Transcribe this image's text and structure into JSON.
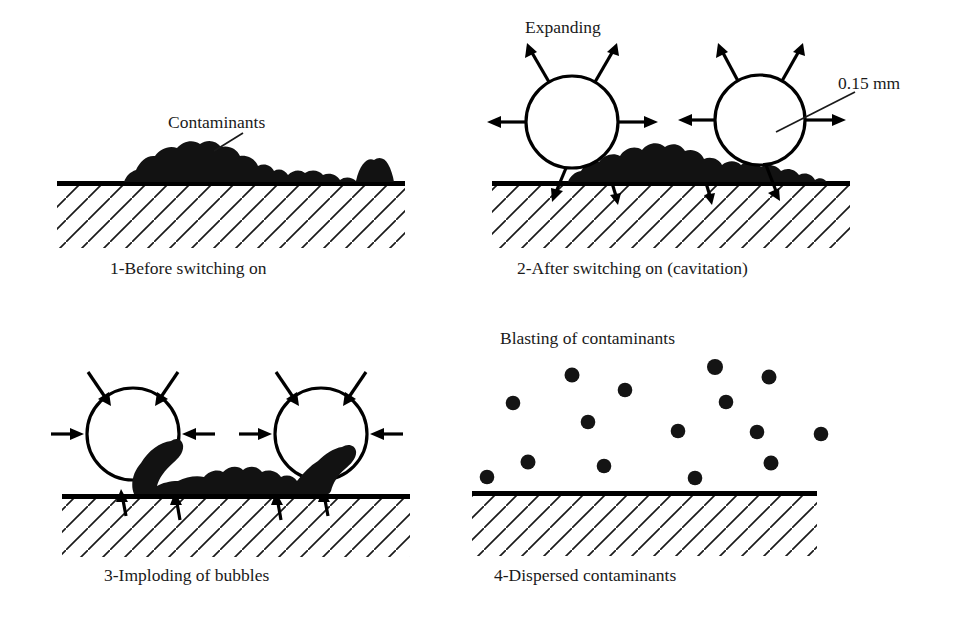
{
  "figure": {
    "background_color": "#ffffff",
    "ink_color": "#111111",
    "width": 966,
    "height": 620
  },
  "panels": [
    {
      "id": "panel-1",
      "number": "1",
      "caption": "1-Before switching on",
      "annotations": [
        {
          "name": "contaminants-label",
          "text": "Contaminants"
        }
      ],
      "has_bubbles": false,
      "has_soil": true,
      "has_particles": false
    },
    {
      "id": "panel-2",
      "number": "2",
      "caption": "2-After switching on (cavitation)",
      "annotations": [
        {
          "name": "expanding-label",
          "text": "Expanding"
        },
        {
          "name": "bubble-size-label",
          "text": "0.15 mm"
        }
      ],
      "has_bubbles": true,
      "bubble_count": 2,
      "bubble_direction": "expanding-outward",
      "has_soil": true,
      "has_particles": false
    },
    {
      "id": "panel-3",
      "number": "3",
      "caption": "3-Imploding of bubbles",
      "annotations": [],
      "has_bubbles": true,
      "bubble_count": 2,
      "bubble_direction": "imploding-inward",
      "has_soil": true,
      "has_particles": false
    },
    {
      "id": "panel-4",
      "number": "4",
      "caption": "4-Dispersed contaminants",
      "annotations": [
        {
          "name": "blasting-label",
          "text": "Blasting of contaminants"
        }
      ],
      "has_bubbles": false,
      "has_soil": false,
      "has_particles": true,
      "particle_count": 15
    }
  ],
  "labels": {
    "contaminants": "Contaminants",
    "expanding": "Expanding",
    "bubble_size": "0.15 mm",
    "blasting": "Blasting of contaminants",
    "caption_1": "1-Before switching on",
    "caption_2": "2-After switching on (cavitation)",
    "caption_3": "3-Imploding of bubbles",
    "caption_4": "4-Dispersed contaminants"
  }
}
